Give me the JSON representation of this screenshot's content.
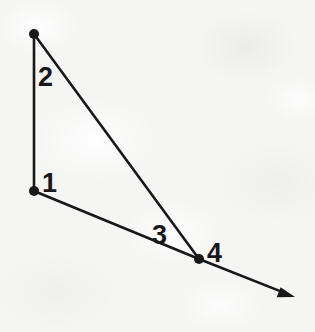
{
  "figure": {
    "kind": "line-diagram",
    "canvas": {
      "width": 315,
      "height": 332
    },
    "background_color": "#f5f5f4",
    "ink_color": "#18181a",
    "stroke_width": 2.6,
    "vertex_dot_radius": 5,
    "points": [
      {
        "name": "top-vertex",
        "x": 34,
        "y": 34,
        "has_dot": true
      },
      {
        "name": "left-middle-vertex",
        "x": 34,
        "y": 191,
        "has_dot": true
      },
      {
        "name": "right-vertex",
        "x": 199,
        "y": 259,
        "has_dot": true
      },
      {
        "name": "arrow-tip",
        "x": 295,
        "y": 297,
        "has_dot": false
      }
    ],
    "edges": [
      {
        "name": "vertical-left-edge",
        "from": "top-vertex",
        "to": "left-middle-vertex",
        "label": "2",
        "arrow": false
      },
      {
        "name": "diagonal-hypotenuse",
        "from": "top-vertex",
        "to": "right-vertex",
        "label": "",
        "arrow": false
      },
      {
        "name": "lower-edge",
        "from": "left-middle-vertex",
        "to": "right-vertex",
        "label": "",
        "arrow": false
      },
      {
        "name": "arrow-extension",
        "from": "right-vertex",
        "to": "arrow-tip",
        "label": "",
        "arrow": true
      }
    ],
    "labels": [
      {
        "name": "label-2",
        "text": "2",
        "x": 38,
        "y": 86,
        "describes": "vertical-left-edge"
      },
      {
        "name": "label-1",
        "text": "1",
        "x": 42,
        "y": 192,
        "describes": "left-middle-vertex"
      },
      {
        "name": "label-3",
        "text": "3",
        "x": 152,
        "y": 244,
        "describes": "angle-region-near-right-vertex"
      },
      {
        "name": "label-4",
        "text": "4",
        "x": 207,
        "y": 262,
        "describes": "right-vertex"
      }
    ],
    "arrowhead": {
      "name": "arrowhead",
      "length": 17,
      "half_width": 7
    }
  }
}
